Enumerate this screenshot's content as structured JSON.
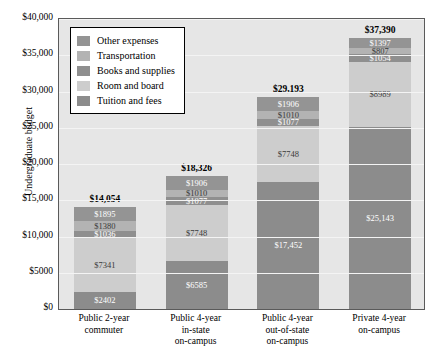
{
  "chart_data": {
    "type": "bar",
    "subtype": "stacked",
    "title": "",
    "xlabel": "",
    "ylabel": "Undergraduate budget",
    "ylim": [
      0,
      40000
    ],
    "ytick_labels": [
      "$40,000",
      "$35,000",
      "$30,000",
      "$25,000",
      "$20,000",
      "$15,000",
      "$10,000",
      "$5000",
      "$0"
    ],
    "ytick_values": [
      40000,
      35000,
      30000,
      25000,
      20000,
      15000,
      10000,
      5000,
      0
    ],
    "grid": true,
    "legend_position": "upper-left-inside",
    "categories": [
      "Public 2-year commuter",
      "Public 4-year in-state on-campus",
      "Public 4-year out-of-state on-campus",
      "Private 4-year on-campus"
    ],
    "category_lines": [
      [
        "Public 2-year",
        "commuter"
      ],
      [
        "Public 4-year",
        "in-state",
        "on-campus"
      ],
      [
        "Public 4-year",
        "out-of-state",
        "on-campus"
      ],
      [
        "Private 4-year",
        "on-campus"
      ]
    ],
    "series": [
      {
        "name": "Tuition and fees",
        "color": "#8c8c8c",
        "values": [
          2402,
          6585,
          17452,
          25143
        ],
        "labels": [
          "$2402",
          "$6585",
          "$17,452",
          "$25,143"
        ]
      },
      {
        "name": "Room and board",
        "color": "#cdcdcd",
        "values": [
          7341,
          7748,
          7748,
          8989
        ],
        "labels": [
          "$7341",
          "$7748",
          "$7748",
          "$8989"
        ]
      },
      {
        "name": "Books and supplies",
        "color": "#8f8f8f",
        "values": [
          1036,
          1077,
          1077,
          1054
        ],
        "labels": [
          "$1036",
          "$1077",
          "$1077",
          "$1054"
        ]
      },
      {
        "name": "Transportation",
        "color": "#b3b3b3",
        "values": [
          1380,
          1010,
          1010,
          807
        ],
        "labels": [
          "$1380",
          "$1010",
          "$1010",
          "$807"
        ]
      },
      {
        "name": "Other expenses",
        "color": "#949494",
        "values": [
          1895,
          1906,
          1906,
          1397
        ],
        "labels": [
          "$1895",
          "$1906",
          "$1906",
          "$1397"
        ]
      }
    ],
    "totals": [
      14054,
      18326,
      29193,
      37390
    ],
    "total_labels": [
      "$14,054",
      "$18,326",
      "$29,193",
      "$37,390"
    ],
    "stack_order_bottom_to_top": [
      "Tuition and fees",
      "Room and board",
      "Books and supplies",
      "Transportation",
      "Other expenses"
    ]
  },
  "legend": {
    "items": [
      {
        "label": "Other expenses",
        "color": "#949494"
      },
      {
        "label": "Transportation",
        "color": "#b3b3b3"
      },
      {
        "label": "Books and supplies",
        "color": "#8f8f8f"
      },
      {
        "label": "Room and board",
        "color": "#cdcdcd"
      },
      {
        "label": "Tuition and fees",
        "color": "#8c8c8c"
      }
    ]
  },
  "style": {
    "plot_background": "#e6e6e6",
    "page_background": "#ffffff",
    "gridline_color": "#f4f4f4",
    "axis_color": "#5a5a5a"
  }
}
